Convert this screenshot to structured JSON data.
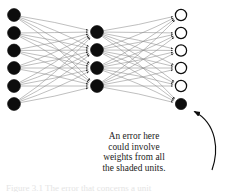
{
  "figure": {
    "type": "neural-network-diagram",
    "background_color": "#ffffff",
    "edge_color": "#8a8a8a",
    "node_fill_shaded": "#0d0d0d",
    "node_fill_hollow": "#ffffff",
    "node_stroke": "#0d0d0d",
    "arrow_color": "#0d0d0d"
  },
  "network": {
    "layers": [
      {
        "name": "input-layer",
        "node_count": 6,
        "style": "shaded",
        "x": 14,
        "radius": 6.4,
        "ys": [
          15,
          33,
          50.5,
          68,
          86,
          104
        ]
      },
      {
        "name": "hidden-layer",
        "node_count": 4,
        "style": "shaded",
        "x": 97,
        "radius": 6.4,
        "ys": [
          32,
          50,
          68,
          86
        ]
      },
      {
        "name": "output-layer",
        "node_count": 6,
        "style": "mixed",
        "x": 181,
        "radius": 5.6,
        "ys": [
          15,
          33,
          50.5,
          68,
          86,
          104
        ],
        "shaded_indices": [
          5
        ],
        "hollow_indices": [
          0,
          1,
          2,
          3,
          4
        ]
      }
    ]
  },
  "annotation": {
    "lines": [
      "An error here",
      "could involve",
      "weights from all",
      "the shaded units."
    ],
    "arrow_target_node": "output-node-6",
    "arrow_start": {
      "x": 212,
      "y": 170
    },
    "arrow_end": {
      "x": 192,
      "y": 111
    }
  },
  "footer": {
    "partial_caption": "Figure 3.1   The error that concerns a unit"
  }
}
